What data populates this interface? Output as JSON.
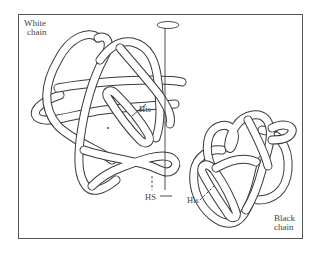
{
  "figure": {
    "labels": {
      "white_chain_line1": "White",
      "white_chain_line2": "chain",
      "black_chain_line1": "Black",
      "black_chain_line2": "chain",
      "his_white": "His",
      "his_black": "His",
      "hs": "HS"
    },
    "colors": {
      "line": "#3a3a3a",
      "frame": "#555555",
      "background": "#ffffff",
      "text": "#444444"
    }
  }
}
